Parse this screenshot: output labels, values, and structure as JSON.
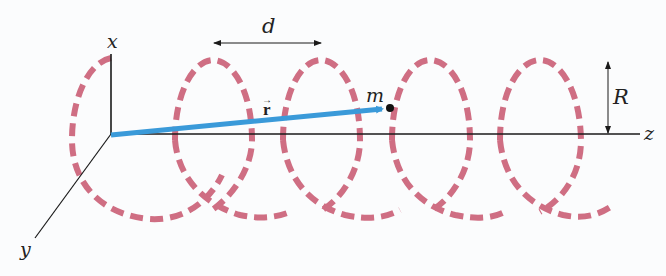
{
  "figure": {
    "axes": {
      "x_label": "x",
      "y_label": "y",
      "z_label": "z"
    },
    "labels": {
      "pitch": "d",
      "radius": "R",
      "mass": "m",
      "position_vector": "r",
      "position_vector_arrow": "→"
    },
    "colors": {
      "helix": "#cf6e83",
      "position_vector": "#3a9ad9",
      "axes": "#1a1a1a",
      "background": "#fbfcfd"
    },
    "helix": {
      "style": "dashed",
      "visible_turns": 5
    }
  }
}
